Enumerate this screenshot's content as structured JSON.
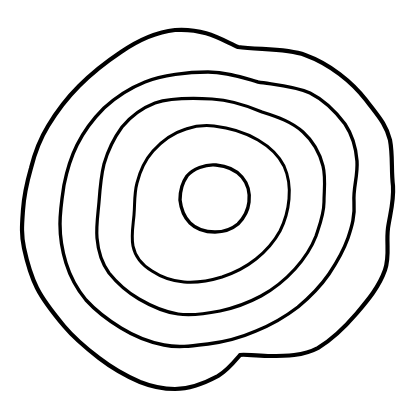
{
  "artwork": {
    "title": "Nested Concentric Contour Rings",
    "medium": "hand-drawn ink line art",
    "subject": "five nested irregular closed contour rings resembling topographic contour lines or tree growth rings",
    "background_color": "#ffffff",
    "ink_color": "#000000",
    "canvas": {
      "width": 413,
      "height": 409
    },
    "ring_count": 5,
    "rings": [
      {
        "index": 1,
        "name": "outermost-ring",
        "stroke_color": "#000000",
        "stroke_width": 4.2,
        "bounds": {
          "left": 22,
          "top": 29,
          "right": 395,
          "bottom": 390
        },
        "notable_feature": "sharp kink notch on lower right at approximately x=240 y=355",
        "path": "M 175 30 C 205 28 222 40 238 47 C 258 50 286 48 305 55 C 330 64 352 82 366 100 C 378 116 386 124 390 140 C 393 156 391 170 393 186 C 394 202 390 214 388 228 C 386 244 390 256 385 270 C 379 287 368 300 357 313 C 345 327 333 339 318 348 C 303 356 286 356 268 356 C 254 356 245 354 240 355 C 234 362 228 370 218 376 C 205 383 190 389 175 389 C 160 389 150 386 140 382 C 126 376 112 368 99 358 C 86 348 74 338 64 326 C 54 314 44 302 37 288 C 30 274 27 262 24 248 C 21 234 22 224 23 210 C 24 195 27 182 31 168 C 35 152 40 139 48 126 C 57 111 67 98 79 86 C 92 73 106 62 121 52 C 137 41 157 32 175 30 Z"
      },
      {
        "index": 2,
        "name": "second-ring",
        "stroke_color": "#000000",
        "stroke_width": 3.4,
        "bounds": {
          "left": 60,
          "top": 70,
          "right": 358,
          "bottom": 356
        },
        "path": "M 208 72 C 228 72 244 78 258 82 C 276 85 294 86 310 93 C 326 101 336 112 345 124 C 353 136 356 148 357 161 C 358 176 353 188 354 202 C 355 216 352 226 348 238 C 343 252 337 262 329 274 C 320 287 310 297 298 307 C 285 317 271 325 256 331 C 240 338 224 342 208 344 C 192 346 178 348 164 345 C 148 342 134 336 121 328 C 108 320 96 311 86 300 C 76 288 70 276 66 263 C 62 250 60 238 60 224 C 60 210 62 198 64 185 C 67 170 71 157 77 145 C 84 131 93 119 104 108 C 116 97 130 88 145 82 C 162 75 188 72 208 72 Z"
      },
      {
        "index": 3,
        "name": "third-ring",
        "stroke_color": "#000000",
        "stroke_width": 3.2,
        "bounds": {
          "left": 96,
          "top": 98,
          "right": 326,
          "bottom": 326
        },
        "path": "M 212 99 C 232 100 248 106 262 112 C 278 117 292 122 303 132 C 314 142 320 154 323 166 C 326 178 324 190 324 202 C 324 214 320 224 316 236 C 311 249 304 259 295 269 C 285 280 274 289 261 296 C 248 303 234 308 220 311 C 205 314 192 316 178 314 C 164 312 151 306 139 299 C 127 292 117 283 109 273 C 101 262 98 250 97 238 C 96 226 98 214 99 202 C 100 188 101 176 104 164 C 108 150 114 138 122 127 C 131 116 142 108 155 103 C 170 98 194 98 212 99 Z"
      },
      {
        "index": 4,
        "name": "fourth-ring",
        "stroke_color": "#000000",
        "stroke_width": 3.0,
        "bounds": {
          "left": 132,
          "top": 125,
          "right": 290,
          "bottom": 290
        },
        "path": "M 214 126 C 232 128 246 133 258 140 C 270 147 279 156 284 166 C 289 177 290 188 289 199 C 288 211 285 221 280 231 C 274 242 266 251 256 259 C 246 267 234 273 222 277 C 209 281 196 283 184 282 C 172 281 161 277 152 271 C 142 265 135 256 133 246 C 131 236 133 226 134 215 C 135 204 134 194 137 183 C 140 171 145 160 153 151 C 162 141 173 133 186 129 C 195 126 205 125 214 126 Z"
      },
      {
        "index": 5,
        "name": "innermost-oval",
        "stroke_color": "#000000",
        "stroke_width": 3.4,
        "bounds": {
          "left": 180,
          "top": 164,
          "right": 250,
          "bottom": 233
        },
        "notable_feature": "small tilted egg-shaped oval rotated roughly -25 degrees, the center of the pattern",
        "path": "M 216 165 C 227 166 236 170 242 177 C 248 184 250 193 249 202 C 248 211 244 218 238 224 C 232 229 224 232 215 232 C 205 232 196 229 190 223 C 184 217 181 209 180 200 C 180 191 182 183 187 176 C 193 169 205 164 216 165 Z"
      }
    ]
  }
}
